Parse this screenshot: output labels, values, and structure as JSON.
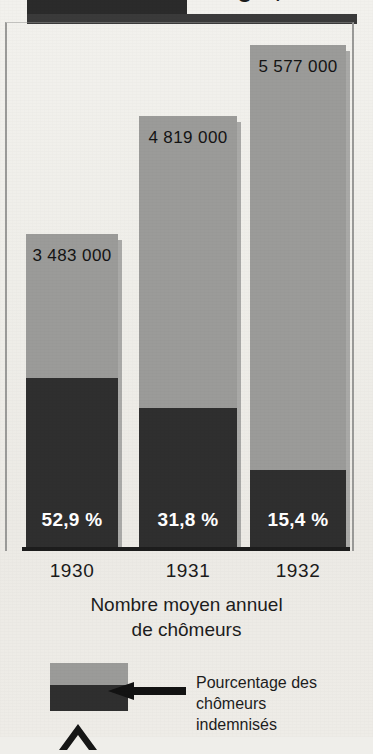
{
  "title_band": {
    "text": "Chômage ,",
    "block_color": "#2b2b2b",
    "rule_color": "#3a3a3a"
  },
  "colors": {
    "total_bar": "#9b9b99",
    "indemnified_segment": "#2f2f2f",
    "paper": "#efeeea",
    "axis": "#1d1d1d",
    "value_label_text": "#141414",
    "percent_label_text": "#ffffff"
  },
  "caption": {
    "line1": "Nombre moyen annuel",
    "line2": "de chômeurs"
  },
  "legend": {
    "label_line1": "Pourcentage des chômeurs",
    "label_line2": "indemnisés",
    "arrow_icon": "left-arrow-icon",
    "swatch_icon": "stacked-bar-swatch-icon",
    "chevron_icon": "chevron-up-icon"
  },
  "chart_data": {
    "type": "bar",
    "subtype": "stacked",
    "title": "Chômage ,",
    "xlabel": "",
    "ylabel": "Nombre moyen annuel de chômeurs",
    "categories": [
      "1930",
      "1931",
      "1932"
    ],
    "grid": false,
    "legend_position": "bottom-left",
    "ylim": [
      0,
      5577000
    ],
    "series": [
      {
        "name": "Nombre moyen annuel de chômeurs",
        "values": [
          3483000,
          4819000,
          5577000
        ],
        "value_labels": [
          "3 483 000",
          "4 819 000",
          "5 577 000"
        ],
        "color": "#9b9b99"
      },
      {
        "name": "Pourcentage des chômeurs indemnisés",
        "unit": "%",
        "values": [
          52.9,
          31.8,
          15.4
        ],
        "value_labels": [
          "52,9 %",
          "31,8 %",
          "15,4 %"
        ],
        "color": "#2f2f2f"
      }
    ],
    "bars": [
      {
        "category": "1930",
        "total": 3483000,
        "total_label": "3 483 000",
        "percent": 52.9,
        "percent_label": "52,9 %",
        "left_px": 26,
        "width_px": 92,
        "top_px": 234,
        "segment_top_px": 378
      },
      {
        "category": "1931",
        "total": 4819000,
        "total_label": "4 819 000",
        "percent": 31.8,
        "percent_label": "31,8 %",
        "left_px": 139,
        "width_px": 98,
        "top_px": 116,
        "segment_top_px": 408
      },
      {
        "category": "1932",
        "total": 5577000,
        "total_label": "5 577 000",
        "percent": 15.4,
        "percent_label": "15,4 %",
        "left_px": 250,
        "width_px": 96,
        "top_px": 45,
        "segment_top_px": 470
      }
    ]
  }
}
